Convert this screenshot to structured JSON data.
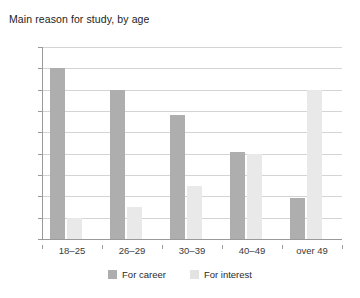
{
  "chart_data": {
    "type": "bar",
    "title": "Main reason for study, by age",
    "xlabel": "",
    "ylabel": "",
    "ylim": [
      0,
      90
    ],
    "yticks": [
      0,
      10,
      20,
      30,
      40,
      50,
      60,
      70,
      80,
      90
    ],
    "grid": true,
    "legend_position": "bottom",
    "categories": [
      "18–25",
      "26–29",
      "30–39",
      "40–49",
      "over 49"
    ],
    "series": [
      {
        "name": "For career",
        "color": "#aeaeae",
        "values": [
          80,
          70,
          58,
          41,
          19
        ]
      },
      {
        "name": "For interest",
        "color": "#e9e9e9",
        "values": [
          10,
          15,
          25,
          40,
          70
        ]
      }
    ]
  }
}
